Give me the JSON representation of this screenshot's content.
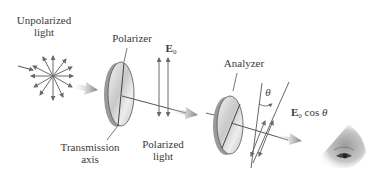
{
  "diagram": {
    "labels": {
      "unpolarized_line1": "Unpolarized",
      "unpolarized_line2": "light",
      "polarizer": "Polarizer",
      "transmission_line1": "Transmission",
      "transmission_line2": "axis",
      "polarized_line1": "Polarized",
      "polarized_line2": "light",
      "analyzer": "Analyzer",
      "e0_symbol": "E",
      "e0_subscript": "0",
      "e0cos_symbol": "E",
      "e0cos_subscript": "0",
      "e0cos_text": " cos ",
      "theta_symbol": "θ",
      "angle_theta": "θ"
    },
    "colors": {
      "arrow": "#6b6b6b",
      "line": "#555555",
      "disk_face": "#d9d9d9",
      "disk_edge": "#9a9a9a",
      "beam": "#8a8a8a",
      "text": "#3a3a3a"
    }
  }
}
